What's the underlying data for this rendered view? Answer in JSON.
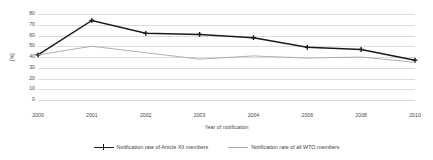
{
  "chart_data": {
    "type": "line",
    "title": "",
    "xlabel": "Year of notification",
    "ylabel": "[%]",
    "categories": [
      "2000",
      "2001",
      "2002",
      "2003",
      "2004",
      "2006",
      "2008",
      "2010"
    ],
    "ylim": [
      0,
      80
    ],
    "yticks": [
      0,
      10,
      20,
      30,
      40,
      50,
      60,
      70,
      80
    ],
    "ytick_labels": [
      "0",
      "10",
      "20",
      "30",
      "40",
      "50",
      "60",
      "70",
      "80"
    ],
    "grid": true,
    "legend_position": "bottom",
    "series": [
      {
        "name": "Notification rate of Article XII members",
        "color": "#1a1a1a",
        "marker": "cross",
        "values": [
          42,
          74,
          62,
          61,
          58,
          49,
          47,
          37
        ]
      },
      {
        "name": "Notification rate of all WTO members",
        "color": "#a6a6a6",
        "marker": "none",
        "values": [
          42,
          50,
          44,
          38,
          41,
          39,
          40,
          35
        ]
      }
    ]
  },
  "colors": {
    "series_article_xii": "#1a1a1a",
    "series_all_wto": "#a6a6a6",
    "gridline": "#dcdcdc",
    "text": "#4a4a4a",
    "background": "#ffffff"
  }
}
